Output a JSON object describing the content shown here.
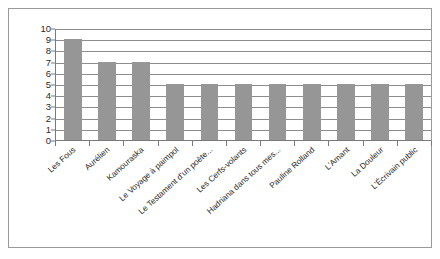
{
  "chart_data": {
    "type": "bar",
    "title": "",
    "subtitle": "",
    "xlabel": "",
    "ylabel": "",
    "ylim": [
      0,
      10
    ],
    "y_ticks": [
      0,
      1,
      2,
      3,
      4,
      5,
      6,
      7,
      8,
      9,
      10
    ],
    "grid": true,
    "legend": false,
    "legend_position": "none",
    "bar_color": "#969696",
    "categories": [
      "Les Fous",
      "Aurélien",
      "Kamouraska",
      "Le Voyage à paimpol",
      "Le Testament d'un poète...",
      "Les Cerfs-volants",
      "Hadriana dans tous mes...",
      "Pauline Rolland",
      "L'Amant",
      "La Douleur",
      "L'Écrivain public"
    ],
    "values": [
      9,
      7,
      7,
      5,
      5,
      5,
      5,
      5,
      5,
      5,
      5
    ]
  },
  "figure": {
    "border_color": "#9a9a9a",
    "background": "#ffffff"
  }
}
